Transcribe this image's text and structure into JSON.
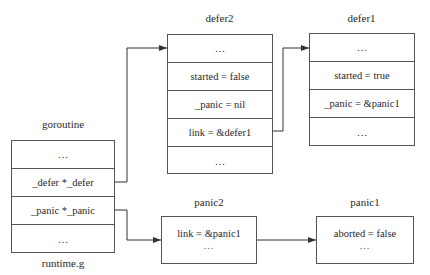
{
  "goroutine": {
    "title": "goroutine",
    "caption": "runtime.g",
    "rows": [
      "…",
      "_defer *_defer",
      "_panic *_panic",
      "…"
    ]
  },
  "defer2": {
    "title": "defer2",
    "rows": [
      "…",
      "started = false",
      "_panic = nil",
      "link = &defer1",
      "…"
    ]
  },
  "defer1": {
    "title": "defer1",
    "rows": [
      "…",
      "started = true",
      "_panic = &panic1",
      "…"
    ]
  },
  "panic2": {
    "title": "panic2",
    "lines": [
      "link = &panic1",
      "…"
    ]
  },
  "panic1": {
    "title": "panic1",
    "lines": [
      "aborted = false",
      "…"
    ]
  },
  "edges": [
    {
      "from": "goroutine._defer",
      "to": "defer2"
    },
    {
      "from": "defer2.link",
      "to": "defer1"
    },
    {
      "from": "goroutine._panic",
      "to": "panic2"
    },
    {
      "from": "panic2",
      "to": "panic1"
    }
  ]
}
